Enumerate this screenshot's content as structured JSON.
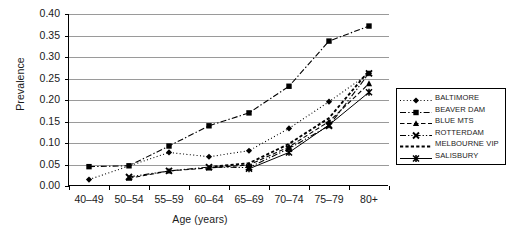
{
  "chart_data": {
    "type": "line",
    "title": "",
    "xlabel": "Age (years)",
    "ylabel": "Prevalence",
    "categories": [
      "40–49",
      "50–54",
      "55–59",
      "60–64",
      "65–69",
      "70–74",
      "75–79",
      "80+"
    ],
    "ylim": [
      0.0,
      0.4
    ],
    "ytick_labels": [
      "0.00",
      "0.05",
      "0.10",
      "0.15",
      "0.20",
      "0.25",
      "0.30",
      "0.35",
      "0.40"
    ],
    "ytick_values": [
      0.0,
      0.05,
      0.1,
      0.15,
      0.2,
      0.25,
      0.3,
      0.35,
      0.4
    ],
    "grid": true,
    "legend_position": "right",
    "series": [
      {
        "name": "BALTIMORE",
        "marker": "diamond",
        "dash": "dotted",
        "values": [
          0.015,
          null,
          0.078,
          0.068,
          0.082,
          0.134,
          0.196,
          0.262
        ]
      },
      {
        "name": "BEAVER DAM",
        "marker": "square",
        "dash": "dash-dot",
        "values": [
          0.045,
          0.047,
          0.093,
          0.14,
          0.17,
          0.232,
          0.337,
          0.372
        ]
      },
      {
        "name": "BLUE MTS",
        "marker": "triangle",
        "dash": "dashed",
        "values": [
          null,
          0.018,
          0.035,
          0.042,
          0.049,
          0.091,
          0.15,
          0.238
        ]
      },
      {
        "name": "ROTTERDAM",
        "marker": "x-cross",
        "dash": "dash-dot-dot",
        "values": [
          null,
          0.021,
          0.035,
          0.044,
          0.043,
          0.087,
          0.14,
          0.262
        ]
      },
      {
        "name": "MELBOURNE VIP",
        "marker": "none",
        "dash": "short-dash-bold",
        "values": [
          null,
          null,
          null,
          0.044,
          0.053,
          0.098,
          0.158,
          0.268
        ]
      },
      {
        "name": "SALISBURY",
        "marker": "asterisk",
        "dash": "solid",
        "values": [
          null,
          null,
          null,
          null,
          0.04,
          0.078,
          0.142,
          0.218
        ]
      }
    ]
  },
  "legend": {
    "items": [
      {
        "label": "BALTIMORE"
      },
      {
        "label": "BEAVER DAM"
      },
      {
        "label": "BLUE MTS"
      },
      {
        "label": "ROTTERDAM"
      },
      {
        "label": "MELBOURNE VIP"
      },
      {
        "label": "SALISBURY"
      }
    ]
  },
  "colors": {
    "axis": "#000000",
    "grid": "#9a9a9a",
    "series": "#000000",
    "background": "#ffffff"
  }
}
